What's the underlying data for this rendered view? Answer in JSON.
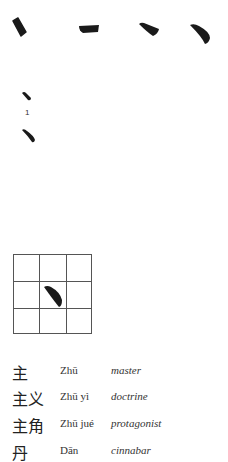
{
  "stroke_sequence": {
    "steps": [
      "dot-stroke-1",
      "horizontal-stroke-2",
      "dot-stroke-3",
      "curved-stroke-4"
    ]
  },
  "stroke_detail": {
    "label": "1"
  },
  "practice_grid": {
    "rows": 3,
    "cols": 3,
    "highlight": "dot-stroke"
  },
  "vocabulary": [
    {
      "hanzi": "主",
      "pinyin": "Zhū",
      "meaning": "master"
    },
    {
      "hanzi": "主义",
      "pinyin": "Zhū yì",
      "meaning": "doctrine"
    },
    {
      "hanzi": "主角",
      "pinyin": "Zhū jué",
      "meaning": "protagonist"
    },
    {
      "hanzi": "丹",
      "pinyin": "Dān",
      "meaning": "cinnabar"
    }
  ],
  "colors": {
    "ink": "#1a1a1a",
    "grid_line": "#555555",
    "background": "#ffffff"
  }
}
